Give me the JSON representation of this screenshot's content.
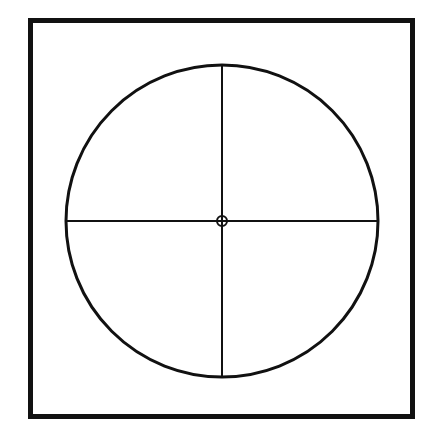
{
  "figure": {
    "title": "Circle with crosshair inside square frame",
    "canvas": {
      "width": 439,
      "height": 438,
      "background_color": "#ffffff"
    },
    "ink_color": "#111111",
    "elements": {
      "frame": {
        "name": "square-frame",
        "shape": "rectangle",
        "x": 30.5,
        "y": 20.5,
        "width": 382,
        "height": 396,
        "stroke_width": 5,
        "stroke_color": "#111111",
        "fill": "none"
      },
      "circle": {
        "name": "main-circle",
        "shape": "circle",
        "center_x": 222,
        "center_y": 221,
        "radius": 156,
        "stroke_width": 3,
        "stroke_color": "#111111",
        "fill": "none"
      },
      "vertical_diameter": {
        "name": "vertical-crosshair",
        "shape": "line",
        "x1": 222,
        "y1": 65,
        "x2": 222,
        "y2": 377,
        "stroke_width": 2,
        "stroke_color": "#111111"
      },
      "horizontal_diameter": {
        "name": "horizontal-crosshair",
        "shape": "line",
        "x1": 66,
        "y1": 221,
        "x2": 378,
        "y2": 221,
        "stroke_width": 2,
        "stroke_color": "#111111"
      },
      "center_marker": {
        "name": "center-ring",
        "shape": "circle",
        "center_x": 222,
        "center_y": 221,
        "radius": 5,
        "stroke_width": 2,
        "stroke_color": "#111111",
        "fill": "none"
      }
    }
  }
}
